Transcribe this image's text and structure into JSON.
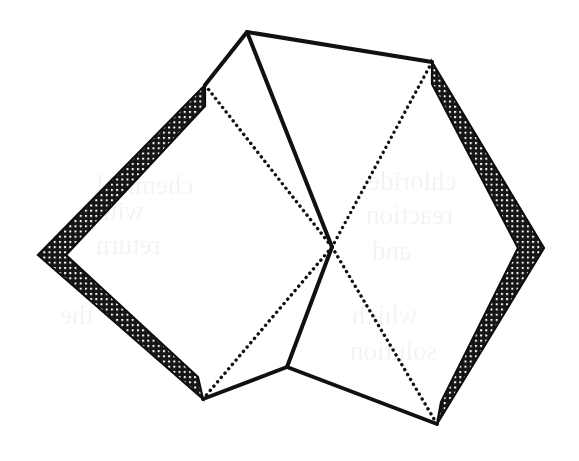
{
  "figure": {
    "canvas": {
      "width": 579,
      "height": 461,
      "background": "#ffffff"
    },
    "colors": {
      "ink": "#111111",
      "band_fill": "#151515",
      "band_mesh_dot": "#ffffff",
      "paper": "#ffffff",
      "ghost": "#000000"
    },
    "style": {
      "solid_stroke_width": 4,
      "dotted_stroke_width": 3.4,
      "dotted_dash_pattern": "0.1 5.6",
      "band_thickness": 21
    },
    "vertices": {
      "top_apex": {
        "x": 247,
        "y": 32,
        "name": "top-apex"
      },
      "left_band_top": {
        "x": 205,
        "y": 85,
        "name": "left-frame-top-corner"
      },
      "left_band_west": {
        "x": 38,
        "y": 255,
        "name": "left-frame-west-corner"
      },
      "left_band_south": {
        "x": 203,
        "y": 399,
        "name": "left-frame-south-corner"
      },
      "right_band_top": {
        "x": 432,
        "y": 62,
        "name": "right-frame-top-corner"
      },
      "right_band_east": {
        "x": 544,
        "y": 248,
        "name": "right-frame-east-corner"
      },
      "right_band_south": {
        "x": 437,
        "y": 424,
        "name": "right-frame-south-corner"
      },
      "center_cross": {
        "x": 332,
        "y": 247,
        "name": "center-crossing"
      },
      "bottom_node": {
        "x": 287,
        "y": 367,
        "name": "bottom-junction"
      }
    },
    "edges": [
      {
        "name": "apex-to-left-top",
        "kind": "solid",
        "from": "top_apex",
        "to": "left_band_top"
      },
      {
        "name": "apex-to-right-top",
        "kind": "solid",
        "from": "top_apex",
        "to": "right_band_top"
      },
      {
        "name": "apex-to-center",
        "kind": "solid",
        "from": "top_apex",
        "to": "center_cross"
      },
      {
        "name": "center-to-bottom-node",
        "kind": "solid",
        "from": "center_cross",
        "to": "bottom_node"
      },
      {
        "name": "bottom-node-to-left-south",
        "kind": "solid",
        "from": "bottom_node",
        "to": "left_band_south"
      },
      {
        "name": "bottom-node-to-right-south",
        "kind": "solid",
        "from": "bottom_node",
        "to": "right_band_south"
      },
      {
        "name": "left-top-to-center-hidden",
        "kind": "dotted",
        "from": "left_band_top",
        "to": "center_cross"
      },
      {
        "name": "center-to-left-south-hidden",
        "kind": "dotted",
        "from": "center_cross",
        "to": "left_band_south"
      },
      {
        "name": "right-top-to-center-hidden",
        "kind": "dotted",
        "from": "right_band_top",
        "to": "center_cross"
      },
      {
        "name": "center-to-right-south-hidden",
        "kind": "dotted",
        "from": "center_cross",
        "to": "right_band_south"
      }
    ],
    "bands": [
      {
        "name": "left-frame-band",
        "outer": [
          [
            205,
            85
          ],
          [
            38,
            255
          ],
          [
            203,
            399
          ]
        ],
        "inner": [
          [
            205,
            106
          ],
          [
            66,
            255
          ],
          [
            198,
            377
          ]
        ]
      },
      {
        "name": "right-frame-band",
        "outer": [
          [
            432,
            62
          ],
          [
            544,
            248
          ],
          [
            437,
            424
          ]
        ],
        "inner": [
          [
            432,
            84
          ],
          [
            518,
            248
          ],
          [
            441,
            402
          ]
        ]
      }
    ],
    "ghost_text": [
      {
        "text": "chemical",
        "x": 96,
        "y": 170,
        "size": 27
      },
      {
        "text": "with",
        "x": 96,
        "y": 196,
        "size": 27
      },
      {
        "text": "return",
        "x": 96,
        "y": 230,
        "size": 27
      },
      {
        "text": "chloride",
        "x": 368,
        "y": 166,
        "size": 27
      },
      {
        "text": "reaction",
        "x": 366,
        "y": 200,
        "size": 27
      },
      {
        "text": "and",
        "x": 372,
        "y": 236,
        "size": 27
      },
      {
        "text": "the",
        "x": 60,
        "y": 300,
        "size": 27
      },
      {
        "text": "which",
        "x": 352,
        "y": 300,
        "size": 27
      },
      {
        "text": "solution",
        "x": 350,
        "y": 336,
        "size": 27
      }
    ]
  }
}
